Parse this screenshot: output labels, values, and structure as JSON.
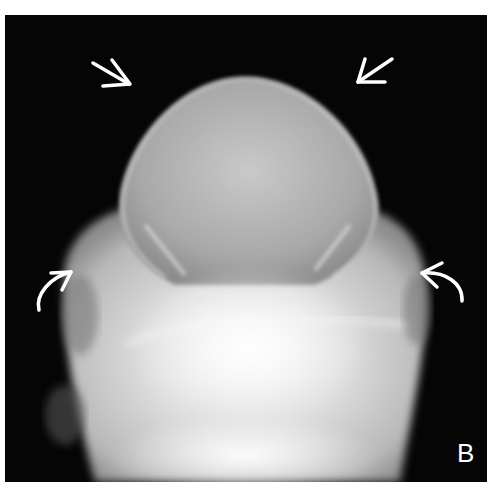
{
  "figure": {
    "panel_label": "B",
    "annotations": [
      {
        "type": "straight-arrow",
        "position": "upper-left",
        "direction": "down-right"
      },
      {
        "type": "straight-arrow",
        "position": "upper-right",
        "direction": "down-left"
      },
      {
        "type": "curved-arrow",
        "position": "mid-left",
        "direction": "up-right"
      },
      {
        "type": "curved-arrow",
        "position": "mid-right",
        "direction": "up-left"
      }
    ],
    "colors": {
      "background": "#ffffff",
      "frame": "#050505",
      "annotation": "#ffffff"
    }
  }
}
